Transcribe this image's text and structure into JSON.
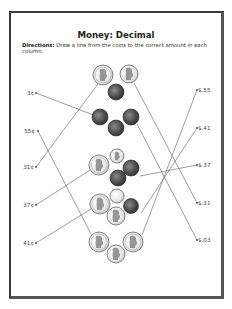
{
  "worksheet": {
    "title": "Money: Decimal",
    "directions_label": "Directions:",
    "directions_text": " Draw a line from the coins to the correct amount in each column."
  },
  "left_column": {
    "amounts": [
      "3¢",
      "55¢",
      "31¢",
      "37¢",
      "41¢"
    ]
  },
  "right_column": {
    "amounts": [
      "$.55",
      "$.41",
      "$.37",
      "$.31",
      "$.03"
    ]
  },
  "coin_groups": [
    {
      "coins": [
        "quarter",
        "nickel",
        "penny"
      ],
      "total_cents": 31
    },
    {
      "coins": [
        "penny",
        "penny",
        "penny"
      ],
      "total_cents": 3
    },
    {
      "coins": [
        "quarter",
        "dime",
        "penny",
        "penny"
      ],
      "total_cents": 37
    },
    {
      "coins": [
        "quarter",
        "dime",
        "penny",
        "nickel"
      ],
      "total_cents": 41
    },
    {
      "coins": [
        "quarter",
        "quarter",
        "nickel"
      ],
      "total_cents": 55
    }
  ],
  "matches_drawn": [
    {
      "from": "3¢",
      "to_group": 2
    },
    {
      "from": "55¢",
      "to_group": 5
    },
    {
      "from": "31¢",
      "to_group": 1
    },
    {
      "from": "37¢",
      "to_group": 3
    },
    {
      "from": "41¢",
      "to_group": 4
    },
    {
      "from": "$.55",
      "to_group": 5
    },
    {
      "from": "$.41",
      "to_group": 4
    },
    {
      "from": "$.37",
      "to_group": 3
    },
    {
      "from": "$.31",
      "to_group": 1
    },
    {
      "from": "$.03",
      "to_group": 2
    }
  ],
  "colors": {
    "border": "#3a3a3a",
    "line": "#555555",
    "penny": "#4a4a4a",
    "silver_coin": "#e8e8e8"
  }
}
